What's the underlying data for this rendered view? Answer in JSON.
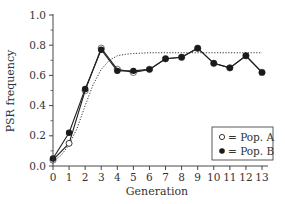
{
  "chart_data": {
    "type": "line",
    "title": "",
    "xlabel": "Generation",
    "ylabel": "PSR frequency",
    "xlim": [
      0,
      13
    ],
    "ylim": [
      0.0,
      1.0
    ],
    "x_ticks": [
      0,
      1,
      2,
      3,
      4,
      5,
      6,
      7,
      8,
      9,
      10,
      11,
      12,
      13
    ],
    "y_ticks": [
      0.0,
      0.2,
      0.4,
      0.6,
      0.8,
      1.0
    ],
    "y_tick_labels": [
      "0.0",
      "0.2",
      "0.4",
      "0.6",
      "0.8",
      "1.0"
    ],
    "grid": false,
    "legend_position": "lower right",
    "series": [
      {
        "name": "Pop. A",
        "marker": "open-circle",
        "x": [
          0,
          1,
          2,
          3,
          4,
          5,
          6,
          7,
          8,
          9,
          10,
          11,
          12,
          13
        ],
        "values": [
          0.04,
          0.15,
          0.5,
          0.78,
          0.64,
          0.62,
          0.64,
          0.71,
          0.72,
          0.78,
          0.68,
          0.65,
          0.73,
          0.62
        ]
      },
      {
        "name": "Pop. B",
        "marker": "filled-circle",
        "x": [
          0,
          1,
          2,
          3,
          4,
          5,
          6,
          7,
          8,
          9,
          10,
          11,
          12,
          13
        ],
        "values": [
          0.05,
          0.22,
          0.51,
          0.77,
          0.63,
          0.63,
          0.64,
          0.71,
          0.72,
          0.78,
          0.68,
          0.65,
          0.73,
          0.62
        ]
      },
      {
        "name": "Model",
        "style": "dotted",
        "x": [
          0,
          0.5,
          1,
          1.5,
          2,
          2.5,
          3,
          3.5,
          4,
          4.5,
          5,
          6,
          7,
          8,
          9,
          10,
          11,
          12,
          13
        ],
        "values": [
          0.03,
          0.07,
          0.14,
          0.25,
          0.4,
          0.54,
          0.64,
          0.7,
          0.73,
          0.74,
          0.745,
          0.75,
          0.75,
          0.75,
          0.75,
          0.75,
          0.75,
          0.75,
          0.75
        ]
      }
    ],
    "legend": [
      {
        "symbol": "open-circle",
        "label": "= Pop. A"
      },
      {
        "symbol": "filled-circle",
        "label": "= Pop. B"
      }
    ]
  },
  "colors": {
    "axis": "#333333",
    "line": "#222222",
    "marker_fill": "#1a1a1a",
    "open_marker_fill": "#ffffff"
  }
}
